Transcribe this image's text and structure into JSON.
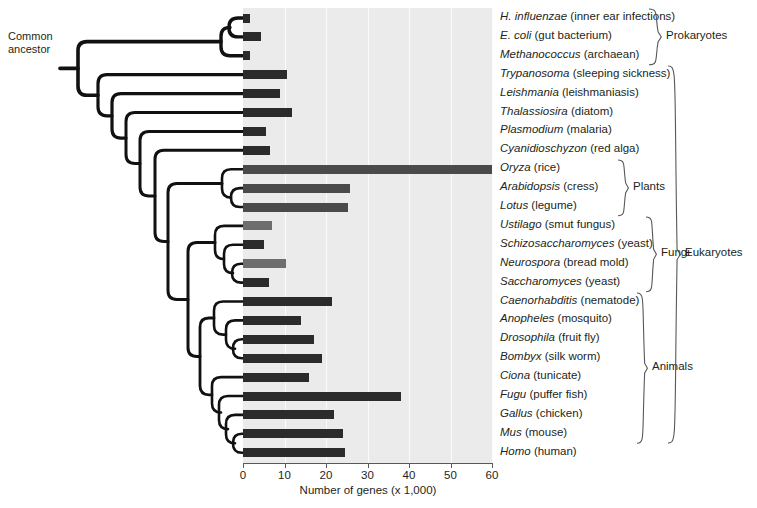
{
  "figure": {
    "ancestor_label": "Common\nancestor",
    "ancestor_line1": "Common",
    "ancestor_line2": "ancestor"
  },
  "axis": {
    "title": "Number of genes (x 1,000)",
    "ticks": [
      "0",
      "10",
      "20",
      "30",
      "40",
      "50",
      "60"
    ],
    "min": 0,
    "max": 60
  },
  "groups": [
    {
      "label": "Prokaryotes",
      "first": 0,
      "last": 2
    },
    {
      "label": "Plants",
      "first": 8,
      "last": 10
    },
    {
      "label": "Fungi",
      "first": 11,
      "last": 14
    },
    {
      "label": "Animals",
      "first": 15,
      "last": 22
    },
    {
      "label": "Eukaryotes",
      "first": 3,
      "last": 22
    }
  ],
  "colors": {
    "plot_background": "#ebebeb",
    "gridline": "#fbfbfb",
    "bar_dark": "#2b2b2b",
    "bar_mid": "#4a4a4a",
    "bar_light": "#6e6e6e",
    "tree_stroke": "#111111",
    "text": "#231f20"
  },
  "chart_data": {
    "type": "bar",
    "title": "",
    "xlabel": "Number of genes (x 1,000)",
    "ylabel": "",
    "xlim": [
      0,
      60
    ],
    "grid": true,
    "orientation": "horizontal",
    "legend": "none",
    "categories": [
      "H. influenzae",
      "E. coli",
      "Methanococcus",
      "Trypanosoma",
      "Leishmania",
      "Thalassiosira",
      "Plasmodium",
      "Cyanidioschyzon",
      "Oryza",
      "Arabidopsis",
      "Lotus",
      "Ustilago",
      "Schizosaccharomyces",
      "Neurospora",
      "Saccharomyces",
      "Caenorhabditis",
      "Anopheles",
      "Drosophila",
      "Bombyx",
      "Ciona",
      "Fugu",
      "Gallus",
      "Mus",
      "Homo"
    ],
    "values": [
      1.7,
      4.3,
      1.7,
      10.5,
      9.0,
      11.8,
      5.6,
      6.5,
      60.0,
      25.8,
      25.2,
      6.9,
      5.0,
      10.3,
      6.3,
      21.5,
      14.0,
      17.0,
      19.0,
      16.0,
      38.0,
      22.0,
      24.0,
      24.5
    ]
  },
  "taxa": [
    {
      "genus": "H. influenzae",
      "common": "(inner ear infections)",
      "value": 1.7,
      "shade": "dark"
    },
    {
      "genus": "E. coli",
      "common": "(gut bacterium)",
      "value": 4.3,
      "shade": "dark"
    },
    {
      "genus": "Methanococcus",
      "common": "(archaean)",
      "value": 1.7,
      "shade": "dark"
    },
    {
      "genus": "Trypanosoma",
      "common": "(sleeping sickness)",
      "value": 10.5,
      "shade": "dark"
    },
    {
      "genus": "Leishmania",
      "common": "(leishmaniasis)",
      "value": 9.0,
      "shade": "dark"
    },
    {
      "genus": "Thalassiosira",
      "common": "(diatom)",
      "value": 11.8,
      "shade": "dark"
    },
    {
      "genus": "Plasmodium",
      "common": "(malaria)",
      "value": 5.6,
      "shade": "dark"
    },
    {
      "genus": "Cyanidioschyzon",
      "common": "(red alga)",
      "value": 6.5,
      "shade": "dark"
    },
    {
      "genus": "Oryza",
      "common": "(rice)",
      "value": 60.0,
      "shade": "mid"
    },
    {
      "genus": "Arabidopsis",
      "common": "(cress)",
      "value": 25.8,
      "shade": "mid"
    },
    {
      "genus": "Lotus",
      "common": "(legume)",
      "value": 25.2,
      "shade": "mid"
    },
    {
      "genus": "Ustilago",
      "common": "(smut fungus)",
      "value": 6.9,
      "shade": "light"
    },
    {
      "genus": "Schizosaccharomyces",
      "common": "(yeast)",
      "value": 5.0,
      "shade": "dark"
    },
    {
      "genus": "Neurospora",
      "common": "(bread mold)",
      "value": 10.3,
      "shade": "light"
    },
    {
      "genus": "Saccharomyces",
      "common": "(yeast)",
      "value": 6.3,
      "shade": "dark"
    },
    {
      "genus": "Caenorhabditis",
      "common": "(nematode)",
      "value": 21.5,
      "shade": "dark"
    },
    {
      "genus": "Anopheles",
      "common": "(mosquito)",
      "value": 14.0,
      "shade": "dark"
    },
    {
      "genus": "Drosophila",
      "common": "(fruit fly)",
      "value": 17.0,
      "shade": "dark"
    },
    {
      "genus": "Bombyx",
      "common": "(silk worm)",
      "value": 19.0,
      "shade": "dark"
    },
    {
      "genus": "Ciona",
      "common": "(tunicate)",
      "value": 16.0,
      "shade": "dark"
    },
    {
      "genus": "Fugu",
      "common": "(puffer fish)",
      "value": 38.0,
      "shade": "dark"
    },
    {
      "genus": "Gallus",
      "common": "(chicken)",
      "value": 22.0,
      "shade": "dark"
    },
    {
      "genus": "Mus",
      "common": "(mouse)",
      "value": 24.0,
      "shade": "dark"
    },
    {
      "genus": "Homo",
      "common": "(human)",
      "value": 24.5,
      "shade": "dark"
    }
  ]
}
